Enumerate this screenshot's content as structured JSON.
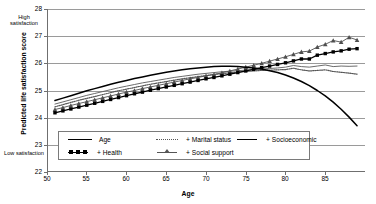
{
  "chart_data": {
    "type": "line",
    "title": "",
    "xlabel": "Age",
    "ylabel": "Predicted life satisfaction score",
    "xlim": [
      50,
      90
    ],
    "ylim": [
      22,
      28
    ],
    "xticks": [
      50,
      55,
      60,
      65,
      70,
      75,
      80,
      85
    ],
    "yticks": [
      22,
      23,
      24,
      25,
      26,
      27,
      28
    ],
    "grid": true,
    "legend_position": "inside-bottom-left",
    "annotations": [
      {
        "name": "high-satisfaction",
        "text": "High satisfaction",
        "position": "top-left-outside"
      },
      {
        "name": "low-satisfaction",
        "text": "Low satisfaction",
        "position": "bottom-left-outside"
      }
    ],
    "x": [
      51,
      52,
      53,
      54,
      55,
      56,
      57,
      58,
      59,
      60,
      61,
      62,
      63,
      64,
      65,
      66,
      67,
      68,
      69,
      70,
      71,
      72,
      73,
      74,
      75,
      76,
      77,
      78,
      79,
      80,
      81,
      82,
      83,
      84,
      85,
      86,
      87,
      88,
      89
    ],
    "series": [
      {
        "name": "Age",
        "style": "solid-thick-black",
        "values": [
          24.63,
          24.72,
          24.81,
          24.9,
          24.99,
          25.07,
          25.15,
          25.23,
          25.3,
          25.37,
          25.44,
          25.5,
          25.56,
          25.62,
          25.67,
          25.72,
          25.76,
          25.8,
          25.83,
          25.86,
          25.88,
          25.89,
          25.89,
          25.88,
          25.86,
          25.83,
          25.79,
          25.73,
          25.66,
          25.57,
          25.46,
          25.33,
          25.18,
          25.0,
          24.8,
          24.57,
          24.31,
          24.02,
          23.7
        ]
      },
      {
        "name": "+ Socioeconomic",
        "style": "solid-thin-gray",
        "values": [
          24.5,
          24.58,
          24.66,
          24.74,
          24.82,
          24.89,
          24.96,
          25.03,
          25.1,
          25.16,
          25.22,
          25.28,
          25.33,
          25.38,
          25.43,
          25.48,
          25.52,
          25.56,
          25.6,
          25.63,
          25.66,
          25.69,
          25.71,
          25.73,
          25.75,
          25.77,
          25.79,
          25.81,
          25.83,
          25.86,
          25.92,
          25.88,
          25.86,
          25.9,
          25.94,
          25.88,
          25.9,
          25.89,
          25.9
        ]
      },
      {
        "name": "+ Marital status",
        "style": "dotted-gray",
        "values": [
          24.4,
          24.48,
          24.56,
          24.64,
          24.71,
          24.78,
          24.85,
          24.92,
          24.99,
          25.05,
          25.11,
          25.17,
          25.23,
          25.28,
          25.33,
          25.38,
          25.43,
          25.47,
          25.51,
          25.55,
          25.59,
          25.62,
          25.65,
          25.68,
          25.7,
          25.72,
          25.74,
          25.75,
          25.76,
          25.77,
          25.82,
          25.76,
          25.72,
          25.74,
          25.76,
          25.7,
          25.67,
          25.64,
          25.6
        ]
      },
      {
        "name": "+ Social support",
        "style": "triangle-markers-gray",
        "values": [
          24.3,
          24.37,
          24.45,
          24.52,
          24.59,
          24.66,
          24.73,
          24.8,
          24.87,
          24.94,
          25.0,
          25.07,
          25.13,
          25.19,
          25.25,
          25.31,
          25.37,
          25.43,
          25.48,
          25.54,
          25.59,
          25.65,
          25.72,
          25.79,
          25.86,
          25.93,
          26.0,
          26.08,
          26.16,
          26.24,
          26.33,
          26.42,
          26.45,
          26.6,
          26.7,
          26.84,
          26.78,
          26.96,
          26.86
        ]
      },
      {
        "name": "+ Health",
        "style": "square-markers-black",
        "values": [
          24.18,
          24.25,
          24.32,
          24.39,
          24.46,
          24.53,
          24.6,
          24.67,
          24.74,
          24.81,
          24.88,
          24.94,
          25.01,
          25.07,
          25.13,
          25.19,
          25.25,
          25.31,
          25.37,
          25.43,
          25.48,
          25.54,
          25.6,
          25.66,
          25.72,
          25.78,
          25.84,
          25.9,
          25.96,
          26.02,
          26.09,
          26.16,
          26.16,
          26.3,
          26.36,
          26.42,
          26.46,
          26.52,
          26.54
        ]
      }
    ]
  },
  "legend": {
    "items": [
      {
        "label": "Age",
        "key": "solid-thick",
        "plus": ""
      },
      {
        "label": "Marital status",
        "key": "dotted",
        "plus": "+"
      },
      {
        "label": "Socioeconomic",
        "key": "solid-thin",
        "plus": "+"
      },
      {
        "label": "Health",
        "key": "square",
        "plus": "+"
      },
      {
        "label": "Social support",
        "key": "triangle",
        "plus": "+"
      }
    ]
  },
  "colors": {
    "series_black": "#000000",
    "series_gray": "#555555",
    "grid": "#9a9a9a",
    "axis": "#6f6f6f",
    "background": "#ffffff"
  }
}
